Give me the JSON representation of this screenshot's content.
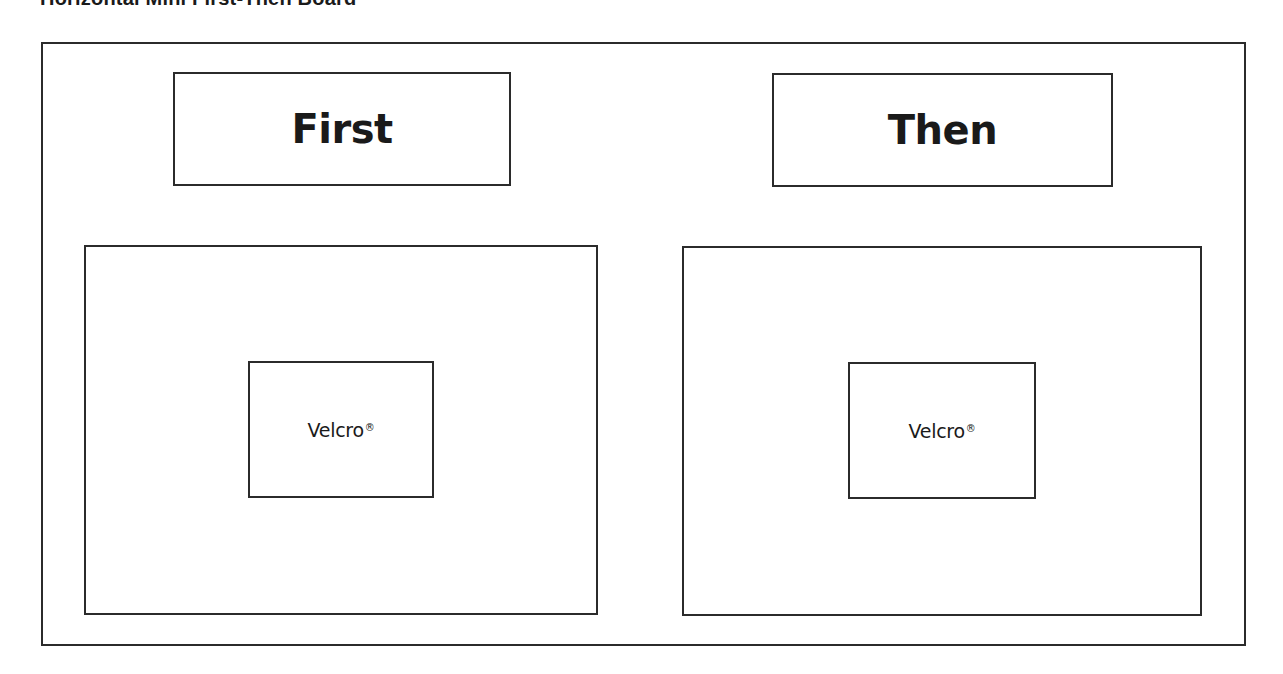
{
  "document": {
    "title": "Horizontal Mini First-Then Board"
  },
  "board": {
    "colors": {
      "border": "#2b2b2b",
      "text": "#1a1a1a",
      "background": "#ffffff"
    },
    "columns": [
      {
        "label": "First",
        "attachment": {
          "text": "Velcro",
          "mark": "®"
        }
      },
      {
        "label": "Then",
        "attachment": {
          "text": "Velcro",
          "mark": "®"
        }
      }
    ]
  }
}
